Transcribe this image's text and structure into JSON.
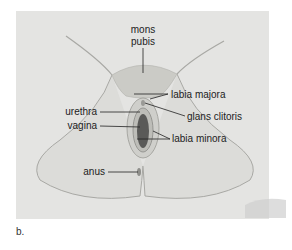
{
  "figure": {
    "panel_label": "b.",
    "labels": {
      "mons_pubis_line1": "mons",
      "mons_pubis_line2": "pubis",
      "labia_majora": "labia majora",
      "glans_clitoris": "glans clitoris",
      "urethra": "urethra",
      "vagina": "vagina",
      "labia_minora": "labia minora",
      "anus": "anus"
    },
    "colors": {
      "background_panel": "#e4e4e2",
      "skin": "#d9d9d6",
      "outline": "#9a9a96",
      "leader_line": "#222222"
    }
  }
}
